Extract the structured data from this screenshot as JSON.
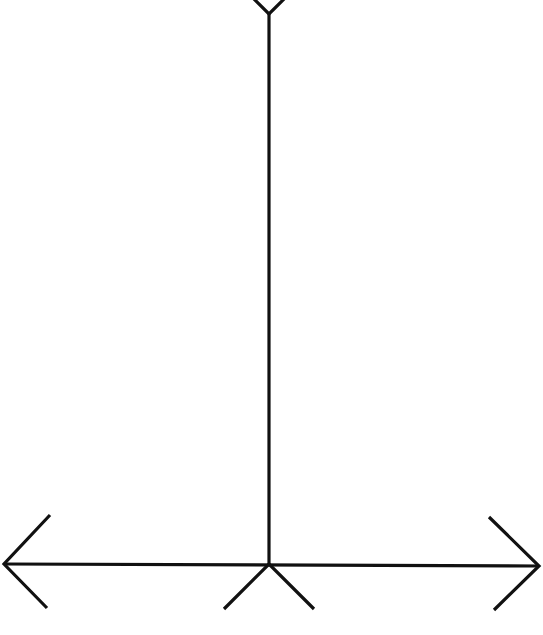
{
  "figure": {
    "stroke_color": "#111111",
    "background": "#ffffff",
    "vertical_line": {
      "x": 269,
      "y_top": 14,
      "y_bottom": 564
    },
    "top_fin": {
      "apex": [
        269,
        14
      ],
      "left_end": [
        253,
        0
      ],
      "right_end": [
        285,
        0
      ]
    },
    "horizontal_line": {
      "y": 564,
      "x_left": 4,
      "x_right": 539
    },
    "left_arrowhead": {
      "apex": [
        4,
        564
      ],
      "upper_end": [
        50,
        515
      ],
      "lower_end": [
        47,
        608
      ]
    },
    "right_arrowhead": {
      "apex": [
        539,
        566
      ],
      "upper_end": [
        489,
        517
      ],
      "lower_end": [
        494,
        610
      ]
    },
    "bottom_fins": {
      "apex": [
        269,
        564
      ],
      "left_end": [
        224,
        609
      ],
      "right_end": [
        314,
        609
      ]
    }
  }
}
